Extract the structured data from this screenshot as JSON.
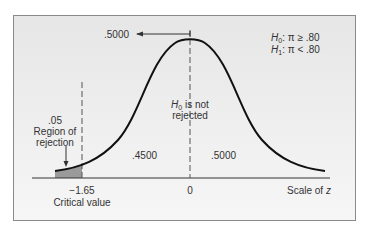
{
  "diagram": {
    "type": "normal-distribution-one-tailed-test",
    "hypotheses": {
      "h0": {
        "symbol": "H",
        "sub": "0",
        "text": ": π ≥ .80"
      },
      "h1": {
        "symbol": "H",
        "sub": "1",
        "text": ": π < .80"
      }
    },
    "top_arrow_label": ".5000",
    "region_of_rejection": {
      "value": ".05",
      "line1": "Region of",
      "line2": "rejection"
    },
    "acceptance_label": {
      "symbol": "H",
      "sub": "0",
      "line1_rest": " is not",
      "line2": "rejected"
    },
    "area_left": ".4500",
    "area_right": ".5000",
    "critical_value": {
      "z": "−1.65",
      "label": "Critical value"
    },
    "center_tick": "0",
    "axis_label_prefix": "Scale of ",
    "axis_label_var": "z",
    "colors": {
      "curve": "#111111",
      "rejection_fill": "#9a9a9a",
      "dashed": "#555555",
      "background": "#ececec",
      "border": "#8a8a8a"
    }
  }
}
